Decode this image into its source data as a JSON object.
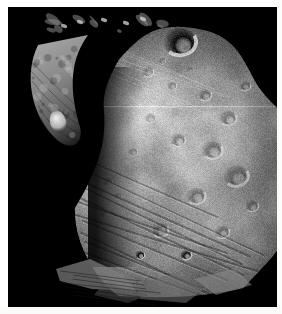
{
  "viewer": {
    "width": 282,
    "height": 314,
    "background_color": "#f2f2f0",
    "mat_color": "#ffffff"
  },
  "photo": {
    "name": "phobos-moon-photograph",
    "alt_text": "Grayscale spacecraft photograph of Phobos, the larger moon of Mars",
    "subject": "Phobos",
    "frame": {
      "x": 8,
      "y": 7,
      "width": 269,
      "height": 300
    },
    "space_color": "#000000",
    "terminator_note": "sharp day/night terminator running from upper-left down through the center-left",
    "palette": {
      "space": "#000000",
      "shadow": "#050505",
      "dark_regolith": "#4e4e4e",
      "mid_regolith": "#8e8e8e",
      "bright_regolith": "#c6c6c6",
      "highlight": "#e8e8e8",
      "crescent_limb": "#9a9a9a",
      "scanline": "#bdbdbd"
    },
    "features": [
      {
        "name": "sunlit-main-disk",
        "label": "Sunlit cratered hemisphere",
        "cx": 175,
        "cy": 165,
        "rx": 112,
        "ry": 140
      },
      {
        "name": "crescent-limb",
        "label": "Illuminated crescent on upper-left limb",
        "cx": 58,
        "cy": 85,
        "rx": 34,
        "ry": 58
      },
      {
        "name": "bright-knob",
        "label": "Bright knob at base of crescent",
        "cx": 58,
        "cy": 119,
        "rx": 7,
        "ry": 11
      },
      {
        "name": "shadowed-crater-upper",
        "label": "Large shadowed crater near the top limb",
        "cx": 180,
        "cy": 42,
        "rx": 20,
        "ry": 12
      },
      {
        "name": "groove-family",
        "label": "Family of parallel linear grooves across lower-left terrain",
        "count": 9
      },
      {
        "name": "crater-chain",
        "label": "Chain of small bright-rimmed craters along the grooves",
        "count": 6
      },
      {
        "name": "lower-limb-fragments",
        "label": "Partially lit ridges along the lower terminator",
        "count": 4
      },
      {
        "name": "scanline-artifact",
        "label": "Faint horizontal image scan line",
        "y": 107
      }
    ],
    "craters": [
      {
        "cx": 180,
        "cy": 42,
        "r": 17,
        "tone": "dark"
      },
      {
        "cx": 148,
        "cy": 72,
        "r": 6,
        "tone": "bright"
      },
      {
        "cx": 162,
        "cy": 61,
        "r": 4,
        "tone": "bright"
      },
      {
        "cx": 172,
        "cy": 86,
        "r": 5,
        "tone": "bright"
      },
      {
        "cx": 190,
        "cy": 70,
        "r": 4,
        "tone": "bright"
      },
      {
        "cx": 205,
        "cy": 95,
        "r": 7,
        "tone": "mid"
      },
      {
        "cx": 228,
        "cy": 118,
        "r": 9,
        "tone": "mid"
      },
      {
        "cx": 245,
        "cy": 86,
        "r": 6,
        "tone": "mid"
      },
      {
        "cx": 212,
        "cy": 150,
        "r": 11,
        "tone": "mid"
      },
      {
        "cx": 178,
        "cy": 140,
        "r": 8,
        "tone": "mid"
      },
      {
        "cx": 150,
        "cy": 118,
        "r": 6,
        "tone": "bright"
      },
      {
        "cx": 133,
        "cy": 152,
        "r": 5,
        "tone": "bright"
      },
      {
        "cx": 108,
        "cy": 182,
        "r": 5,
        "tone": "bright"
      },
      {
        "cx": 118,
        "cy": 196,
        "r": 4,
        "tone": "bright"
      },
      {
        "cx": 104,
        "cy": 214,
        "r": 4,
        "tone": "bright"
      },
      {
        "cx": 196,
        "cy": 196,
        "r": 10,
        "tone": "mid"
      },
      {
        "cx": 236,
        "cy": 176,
        "r": 13,
        "tone": "mid"
      },
      {
        "cx": 160,
        "cy": 230,
        "r": 9,
        "tone": "mid"
      },
      {
        "cx": 222,
        "cy": 232,
        "r": 8,
        "tone": "mid"
      },
      {
        "cx": 252,
        "cy": 206,
        "r": 7,
        "tone": "mid"
      },
      {
        "cx": 186,
        "cy": 255,
        "r": 6,
        "tone": "dark"
      },
      {
        "cx": 140,
        "cy": 255,
        "r": 5,
        "tone": "dark"
      }
    ]
  }
}
